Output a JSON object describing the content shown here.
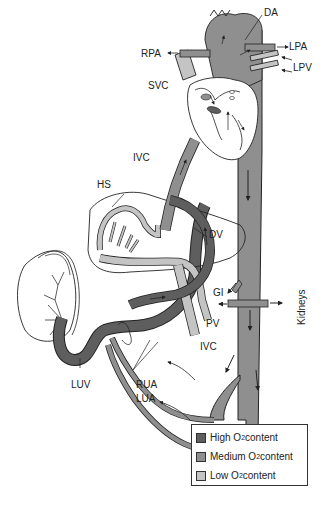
{
  "diagram": {
    "colors": {
      "high_o2": "#5e5e5e",
      "medium_o2": "#8f8f8f",
      "low_o2": "#c4c4c4",
      "outline": "#222222"
    },
    "labels": {
      "da": "DA",
      "rpa": "RPA",
      "lpa": "LPA",
      "lpv": "LPV",
      "svc": "SVC",
      "ivc_upper": "IVC",
      "hs": "HS",
      "dv": "DV",
      "gi": "GI",
      "kidneys": "Kidneys",
      "pv": "PV",
      "ivc_lower": "IVC",
      "luv": "LUV",
      "rua": "RUA",
      "lua": "LUA"
    }
  },
  "legend": {
    "items": [
      {
        "label": "High O",
        "sub": "2",
        "suffix": " content",
        "color": "#5e5e5e"
      },
      {
        "label": "Medium O",
        "sub": "2",
        "suffix": " content",
        "color": "#8f8f8f"
      },
      {
        "label": "Low O",
        "sub": "2",
        "suffix": " content",
        "color": "#c4c4c4"
      }
    ]
  }
}
